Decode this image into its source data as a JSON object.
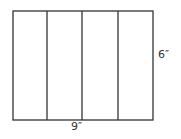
{
  "diagram": {
    "stroke_color": "#333333",
    "rectangle": {
      "x": 13,
      "y": 11,
      "width": 140,
      "height": 109
    },
    "strips": 4,
    "dividers_x": [
      47,
      82,
      118
    ],
    "labels": {
      "width": "9″",
      "height": "6″"
    }
  }
}
